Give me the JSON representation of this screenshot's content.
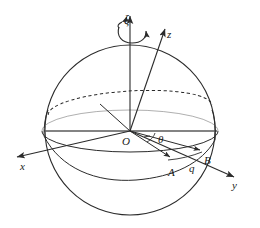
{
  "figure": {
    "kind": "3d-sphere-coordinate-diagram",
    "background": "#ffffff",
    "ink": "#2b2b2b",
    "width": 260,
    "height": 228
  },
  "labels": {
    "xi": "ξ",
    "z": "z",
    "x": "x",
    "y": "y",
    "origin": "O",
    "theta": "θ",
    "point_a": "A",
    "point_b": "B",
    "arc_q": "q"
  },
  "geometry": {
    "sphere": {
      "cx": 130,
      "cy": 130,
      "r": 85
    },
    "origin": {
      "x": 130,
      "y": 131
    },
    "axes": [
      {
        "name": "xi",
        "from": [
          130,
          131
        ],
        "to": [
          130,
          14
        ],
        "arrow": true
      },
      {
        "name": "z",
        "from": [
          130,
          131
        ],
        "to": [
          166,
          26
        ],
        "arrow": true
      },
      {
        "name": "x",
        "from": [
          130,
          131
        ],
        "to": [
          14,
          158
        ],
        "arrow": true
      },
      {
        "name": "y",
        "from": [
          130,
          131
        ],
        "to": [
          237,
          178
        ],
        "arrow": true
      }
    ],
    "equator_ellipse": {
      "cx": 130,
      "cy": 131,
      "rx": 88,
      "ry": 21
    },
    "tilted_circle": {
      "cx": 130,
      "cy": 109,
      "rx": 82,
      "ry": 19,
      "rotate": -4
    },
    "rays": [
      {
        "name": "ray-to-A",
        "from": [
          130,
          131
        ],
        "to": [
          172,
          158
        ],
        "arrow": true
      },
      {
        "name": "ray-to-B",
        "from": [
          130,
          131
        ],
        "to": [
          203,
          151
        ],
        "arrow": true
      },
      {
        "name": "ray-to-tilted-circle",
        "from": [
          130,
          131
        ],
        "to": [
          100,
          104
        ],
        "arrow": false
      }
    ]
  }
}
